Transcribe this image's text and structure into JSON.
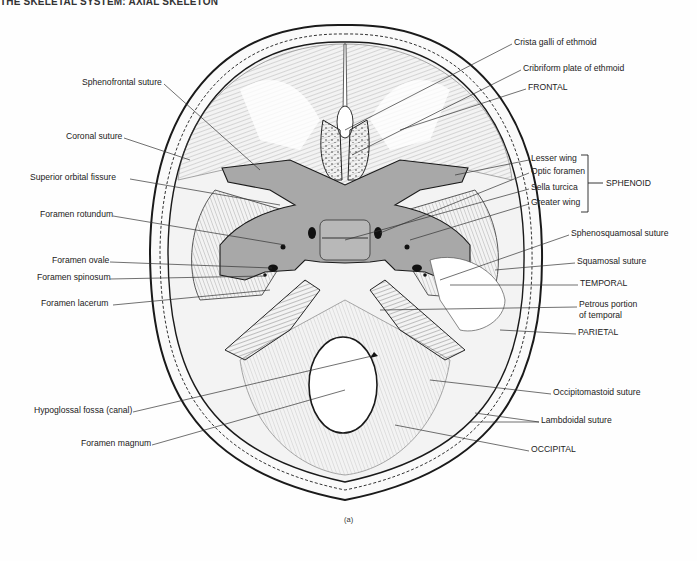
{
  "header": {
    "running_title": "THE SKELETAL SYSTEM: AXIAL SKELETON"
  },
  "figure": {
    "caption": "(a)",
    "colors": {
      "line": "#2a2a2a",
      "sphenoid_fill": "#a8a8a8",
      "background": "#fefefe"
    }
  },
  "labels_left": [
    {
      "id": "sphenofrontal-suture",
      "text": "Sphenofrontal suture",
      "x": 82,
      "y": 81
    },
    {
      "id": "coronal-suture",
      "text": "Coronal suture",
      "x": 66,
      "y": 135
    },
    {
      "id": "superior-orbital-fissure",
      "text": "Superior orbital fissure",
      "x": 30,
      "y": 176
    },
    {
      "id": "foramen-rotundum",
      "text": "Foramen rotundum",
      "x": 40,
      "y": 213
    },
    {
      "id": "foramen-ovale",
      "text": "Foramen ovale",
      "x": 52,
      "y": 259
    },
    {
      "id": "foramen-spinosum",
      "text": "Foramen spinosum",
      "x": 37,
      "y": 276
    },
    {
      "id": "foramen-lacerum",
      "text": "Foramen lacerum",
      "x": 41,
      "y": 302
    },
    {
      "id": "hypoglossal-fossa",
      "text": "Hypoglossal fossa (canal)",
      "x": 34,
      "y": 409
    },
    {
      "id": "foramen-magnum",
      "text": "Foramen magnum",
      "x": 81,
      "y": 442
    }
  ],
  "labels_right": [
    {
      "id": "crista-galli",
      "text": "Crista galli of ethmoid",
      "x": 514,
      "y": 41
    },
    {
      "id": "cribriform-plate",
      "text": "Cribriform plate of ethmoid",
      "x": 523,
      "y": 67
    },
    {
      "id": "frontal",
      "text": "FRONTAL",
      "x": 528,
      "y": 86
    },
    {
      "id": "lesser-wing",
      "text": "Lesser wing",
      "x": 531,
      "y": 157
    },
    {
      "id": "optic-foramen",
      "text": "Optic foramen",
      "x": 531,
      "y": 170
    },
    {
      "id": "sella-turcica",
      "text": "Sella turcica",
      "x": 531,
      "y": 186
    },
    {
      "id": "greater-wing",
      "text": "Greater wing",
      "x": 531,
      "y": 201
    },
    {
      "id": "sphenosquamosal-suture",
      "text": "Sphenosquamosal suture",
      "x": 571,
      "y": 232
    },
    {
      "id": "squamosal-suture",
      "text": "Squamosal suture",
      "x": 577,
      "y": 260
    },
    {
      "id": "temporal",
      "text": "TEMPORAL",
      "x": 580,
      "y": 282
    },
    {
      "id": "petrous-portion-1",
      "text": "Petrous portion",
      "x": 579,
      "y": 303
    },
    {
      "id": "petrous-portion-2",
      "text": "of temporal",
      "x": 579,
      "y": 314
    },
    {
      "id": "parietal",
      "text": "PARIETAL",
      "x": 578,
      "y": 331
    },
    {
      "id": "occipitomastoid-suture",
      "text": "Occipitomastoid suture",
      "x": 553,
      "y": 391
    },
    {
      "id": "lambdoidal-suture",
      "text": "Lambdoidal suture",
      "x": 541,
      "y": 419
    },
    {
      "id": "occipital",
      "text": "OCCIPITAL",
      "x": 531,
      "y": 448
    }
  ],
  "bracket": {
    "label": "SPHENOID",
    "x": 606,
    "y": 178
  }
}
